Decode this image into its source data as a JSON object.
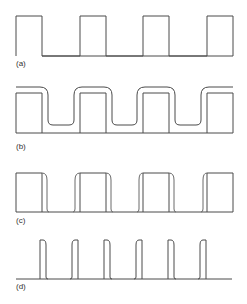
{
  "figure": {
    "panels": [
      {
        "id": "a",
        "label": "(a)",
        "description": "ideal square wave",
        "pulse_count": 4,
        "duty_cycle": 0.41
      },
      {
        "id": "b",
        "label": "(b)",
        "description": "square wave with rounded, offset response",
        "pulse_count": 4
      },
      {
        "id": "c",
        "label": "(c)",
        "description": "square wave with rounded trailing/leading edges",
        "pulse_count": 4
      },
      {
        "id": "d",
        "label": "(d)",
        "description": "narrow pulse train",
        "pulse_count": 6
      }
    ],
    "colors": {
      "line": "#4a4a4a",
      "background": "#ffffff"
    }
  }
}
